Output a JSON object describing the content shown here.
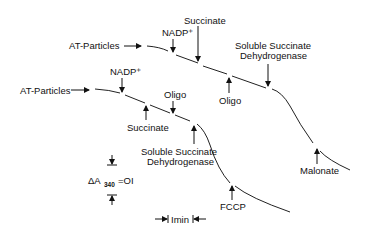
{
  "diagram": {
    "type": "spectrophotometric-trace",
    "traces": [
      {
        "name": "upper",
        "start_label": "AT-Particles",
        "additions": [
          {
            "label": "NADP⁺",
            "dir": "down"
          },
          {
            "label": "Succinate",
            "dir": "down"
          },
          {
            "label": "Oligo",
            "dir": "up"
          },
          {
            "label_line1": "Soluble Succinate",
            "label_line2": "Dehydrogenase",
            "dir": "down"
          },
          {
            "label": "Malonate",
            "dir": "up"
          }
        ]
      },
      {
        "name": "lower",
        "start_label": "AT-Particles",
        "additions": [
          {
            "label": "NADP⁺",
            "dir": "down"
          },
          {
            "label": "Succinate",
            "dir": "up"
          },
          {
            "label": "Oligo",
            "dir": "down"
          },
          {
            "label_line1": "Soluble Succinate",
            "label_line2": "Dehydrogenase",
            "dir": "up"
          },
          {
            "label": "FCCP",
            "dir": "up"
          }
        ]
      }
    ],
    "scale": {
      "absorbance_prefix": "ΔA",
      "absorbance_sub": "340",
      "absorbance_value": "=OI",
      "time": "Imin"
    }
  },
  "labels": {
    "upper_start": "AT-Particles",
    "upper_nadp": "NADP⁺",
    "upper_succinate": "Succinate",
    "upper_oligo": "Oligo",
    "upper_ssd_1": "Soluble Succinate",
    "upper_ssd_2": "Dehydrogenase",
    "upper_malonate": "Malonate",
    "lower_start": "AT-Particles",
    "lower_nadp": "NADP⁺",
    "lower_succinate": "Succinate",
    "lower_oligo": "Oligo",
    "lower_ssd_1": "Soluble Succinate",
    "lower_ssd_2": "Dehydrogenase",
    "lower_fccp": "FCCP",
    "scale_delta": "ΔA",
    "scale_sub": "340",
    "scale_value": "=OI",
    "scale_time": "Imin"
  }
}
